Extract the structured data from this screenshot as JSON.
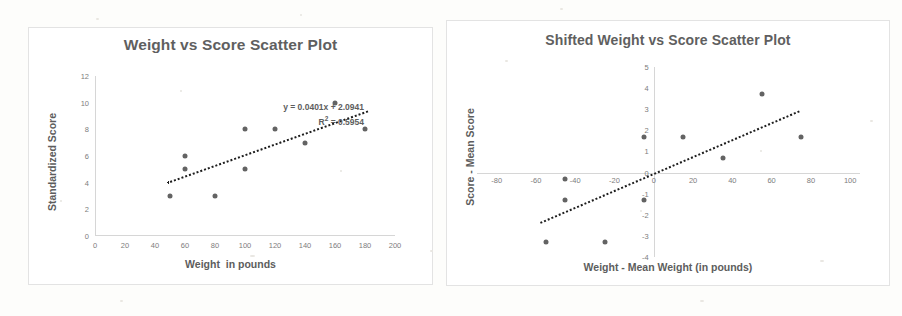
{
  "document": {
    "background": "#fdfdfb",
    "text_color": "#5d5d5d",
    "dot_color": "#636363",
    "trendline_color": "#1d1d1d"
  },
  "chart_data": [
    {
      "id": "weight-vs-score",
      "type": "scatter",
      "title": "Weight vs Score Scatter Plot",
      "xlabel": "Weight  in pounds",
      "ylabel": "Standardized Score",
      "xlim": [
        0,
        200
      ],
      "ylim": [
        0,
        12
      ],
      "xticks": [
        0,
        20,
        40,
        60,
        80,
        100,
        120,
        140,
        160,
        180,
        200
      ],
      "yticks": [
        0,
        2,
        4,
        6,
        8,
        10,
        12
      ],
      "grid": false,
      "legend": "none",
      "x": [
        50,
        60,
        60,
        80,
        100,
        100,
        120,
        140,
        160,
        180
      ],
      "y": [
        3,
        6,
        5,
        3,
        8,
        5,
        8,
        7,
        10,
        8
      ],
      "trendline": {
        "style": "dotted",
        "slope": 0.0401,
        "intercept": 2.0941,
        "x_start": 48,
        "x_end": 182
      },
      "annotations": {
        "equation": "y = 0.0401x + 2.0941",
        "r_squared_prefix": "R",
        "r_squared_exp": "2",
        "r_squared_value": " = 0.5954"
      }
    },
    {
      "id": "shifted-weight-vs-score",
      "type": "scatter",
      "title": "Shifted Weight vs Score Scatter Plot",
      "xlabel": "Weight - Mean Weight (in pounds)",
      "ylabel": "Score - Mean Score",
      "xlim": [
        -90,
        105
      ],
      "ylim": [
        -4,
        5
      ],
      "xticks": [
        -80,
        -60,
        -40,
        -20,
        0,
        20,
        40,
        60,
        80,
        100
      ],
      "yticks": [
        -4,
        -3,
        -2,
        -1,
        0,
        1,
        2,
        3,
        4,
        5
      ],
      "grid": false,
      "legend": "none",
      "x": [
        -55,
        -45,
        -45,
        -25,
        -5,
        -5,
        15,
        35,
        55,
        75
      ],
      "y": [
        -3.3,
        -0.3,
        -1.3,
        -3.3,
        1.7,
        -1.3,
        1.7,
        0.7,
        3.7,
        1.7
      ],
      "trendline": {
        "style": "dotted",
        "slope": 0.0401,
        "intercept": 0,
        "x_start": -58,
        "x_end": 74
      },
      "annotations": {
        "equation": "y = 0.0401x",
        "r_squared_prefix": "R",
        "r_squared_exp": "2",
        "r_squared_value": " = 0.5954"
      }
    }
  ]
}
